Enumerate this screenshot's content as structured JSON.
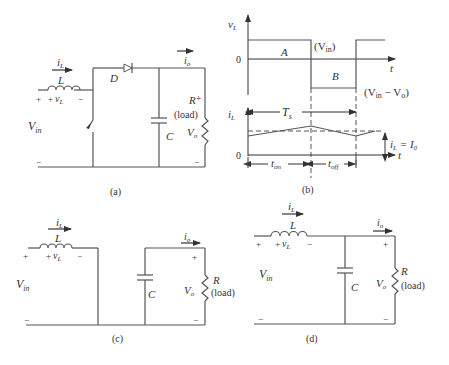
{
  "figure": {
    "panels": {
      "a": {
        "caption": "(a)",
        "labels": {
          "iL": "i",
          "iL_sub": "L",
          "L": "L",
          "plus1": "+",
          "plus2": "+",
          "vL": "v",
          "vL_sub": "L",
          "minus1": "−",
          "Vin": "V",
          "Vin_sub": "in",
          "D": "D",
          "io": "i",
          "io_sub": "o",
          "C": "C",
          "R": "R⁺",
          "load": "(load)",
          "Vo": "V",
          "Vo_sub": "o",
          "minus_left": "−",
          "minus_right": "−"
        }
      },
      "b": {
        "caption": "(b)",
        "labels": {
          "vL": "v",
          "vL_sub": "L",
          "zero_top": "0",
          "t_top": "t",
          "A": "A",
          "B": "B",
          "Vin_level": "(V",
          "Vin_level_sub": "in",
          "Vin_level_close": ")",
          "diff_level": "(V",
          "diff_sub1": "in",
          "diff_mid": " − V",
          "diff_sub2": "o",
          "diff_close": ")",
          "iL": "i",
          "iL_sub": "L",
          "Ts": "T",
          "Ts_sub": "s",
          "zero_bottom": "0",
          "t_bottom": "t",
          "ton": "t",
          "ton_sub": "on",
          "toff": "t",
          "toff_sub": "off",
          "avg": "i",
          "avg_sub": "L",
          "avg_eq": " = I",
          "avg_sub2": "0"
        }
      },
      "c": {
        "caption": "(c)",
        "labels": {
          "iL": "i",
          "iL_sub": "L",
          "L": "L",
          "plus_left": "+",
          "plus_vL": "+",
          "vL": "v",
          "vL_sub": "L",
          "minus_vL": "−",
          "Vin": "V",
          "Vin_sub": "in",
          "minus_left": "−",
          "C": "C",
          "io": "i",
          "io_sub": "o",
          "plus_out": "+",
          "R": "R",
          "load": "(load)",
          "Vo": "V",
          "Vo_sub": "o",
          "minus_out": "−"
        }
      },
      "d": {
        "caption": "(d)",
        "labels": {
          "iL": "i",
          "iL_sub": "L",
          "L": "L",
          "plus_left": "+",
          "plus_vL": "+",
          "vL": "v",
          "vL_sub": "L",
          "minus_vL": "−",
          "Vin": "V",
          "Vin_sub": "in",
          "minus_left": "−",
          "C": "C",
          "io": "i",
          "io_sub": "o",
          "plus_out": "+",
          "R": "R",
          "load": "(load)",
          "Vo": "V",
          "Vo_sub": "o",
          "minus_out": "−"
        }
      }
    }
  }
}
